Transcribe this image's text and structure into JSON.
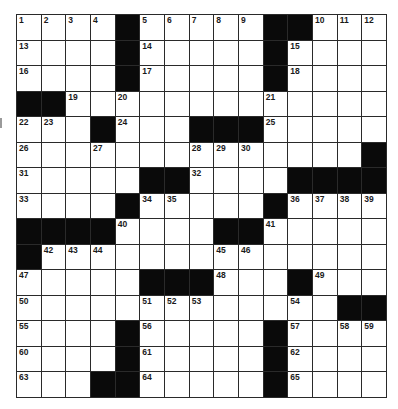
{
  "puzzle": {
    "rows": 15,
    "cols": 15,
    "colors": {
      "block": "#0a0a0a",
      "cell": "#ffffff",
      "line": "#2a2a2a",
      "number": "#1a1a1a"
    },
    "grid": [
      [
        "1",
        "2",
        "3",
        "4",
        "#",
        "5",
        "6",
        "7",
        "8",
        "9",
        "#",
        "#",
        "10",
        "11",
        "12"
      ],
      [
        "13",
        "",
        "",
        "",
        "#",
        "14",
        "",
        "",
        "",
        "",
        "#",
        "15",
        "",
        "",
        ""
      ],
      [
        "16",
        "",
        "",
        "",
        "#",
        "17",
        "",
        "",
        "",
        "",
        "#",
        "18",
        "",
        "",
        ""
      ],
      [
        "#",
        "#",
        "19",
        "",
        "20",
        "",
        "",
        "",
        "",
        "",
        "21",
        "",
        "",
        "",
        ""
      ],
      [
        "22",
        "23",
        "",
        "#",
        "24",
        "",
        "",
        "#",
        "#",
        "#",
        "25",
        "",
        "",
        "",
        ""
      ],
      [
        "26",
        "",
        "",
        "27",
        "",
        "",
        "",
        "28",
        "29",
        "30",
        "",
        "",
        "",
        "",
        "#"
      ],
      [
        "31",
        "",
        "",
        "",
        "",
        "#",
        "#",
        "32",
        "",
        "",
        "",
        "#",
        "#",
        "#",
        "#"
      ],
      [
        "33",
        "",
        "",
        "",
        "#",
        "34",
        "35",
        "",
        "",
        "",
        "#",
        "36",
        "37",
        "38",
        "39"
      ],
      [
        "#",
        "#",
        "#",
        "#",
        "40",
        "",
        "",
        "",
        "#",
        "#",
        "41",
        "",
        "",
        "",
        ""
      ],
      [
        "#",
        "42",
        "43",
        "44",
        "",
        "",
        "",
        "",
        "45",
        "46",
        "",
        "",
        "",
        "",
        ""
      ],
      [
        "47",
        "",
        "",
        "",
        "",
        "#",
        "#",
        "#",
        "48",
        "",
        "",
        "#",
        "49",
        "",
        ""
      ],
      [
        "50",
        "",
        "",
        "",
        "",
        "51",
        "52",
        "53",
        "",
        "",
        "",
        "54",
        "",
        "#",
        "#"
      ],
      [
        "55",
        "",
        "",
        "",
        "#",
        "56",
        "",
        "",
        "",
        "",
        "#",
        "57",
        "",
        "58",
        "59"
      ],
      [
        "60",
        "",
        "",
        "",
        "#",
        "61",
        "",
        "",
        "",
        "",
        "#",
        "62",
        "",
        "",
        ""
      ],
      [
        "63",
        "",
        "",
        "#",
        "#",
        "64",
        "",
        "",
        "",
        "",
        "#",
        "65",
        "",
        "",
        ""
      ]
    ]
  }
}
